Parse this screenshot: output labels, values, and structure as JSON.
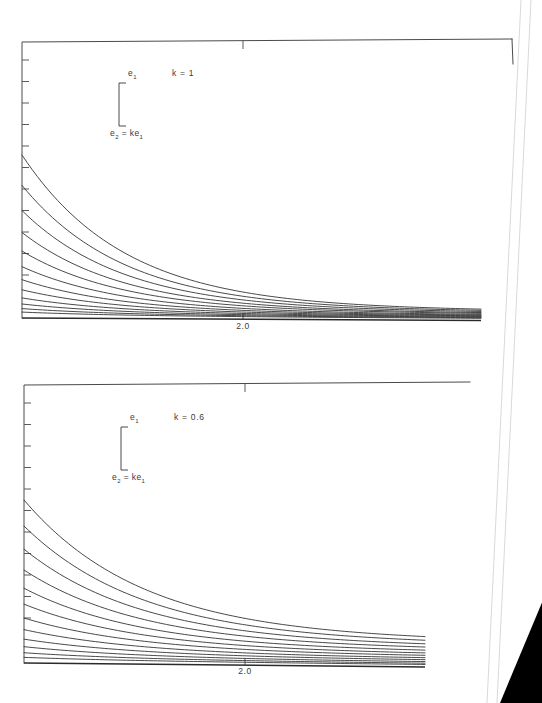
{
  "document": {
    "kind": "scanned-figure-page",
    "background_color": "#ffffff",
    "scanner_background_color": "#000000",
    "ink_color": "#343434",
    "axis_color": "#4a4a4a"
  },
  "chart_data": [
    {
      "id": "top-panel",
      "type": "line",
      "title": "",
      "subtitle": "",
      "annotation_k": "k = 1",
      "annotation_top": "e",
      "annotation_top_sub": "1",
      "annotation_bottom_lhs": "e",
      "annotation_bottom_lhs_sub": "2",
      "annotation_bottom_rhs": "= ke",
      "annotation_bottom_rhs_sub": "1",
      "xlabel": "",
      "ylabel": "",
      "xticklabels": [
        "2.0"
      ],
      "xtick_values": [
        2.0
      ],
      "ytick_count": 11,
      "yticklabels": [],
      "grid": false,
      "legend": "none",
      "xlim": [
        1.0,
        4.6
      ],
      "ylim": [
        0.0,
        1.0
      ],
      "curve_count": 12,
      "series": [
        {
          "name": "curve-1",
          "decay": 2.05,
          "y0": 0.56,
          "yinf": 0.03
        },
        {
          "name": "curve-2",
          "decay": 2.05,
          "y0": 0.455,
          "yinf": 0.027
        },
        {
          "name": "curve-3",
          "decay": 2.05,
          "y0": 0.368,
          "yinf": 0.024
        },
        {
          "name": "curve-4",
          "decay": 2.05,
          "y0": 0.292,
          "yinf": 0.021
        },
        {
          "name": "curve-5",
          "decay": 2.05,
          "y0": 0.228,
          "yinf": 0.019
        },
        {
          "name": "curve-6",
          "decay": 2.05,
          "y0": 0.174,
          "yinf": 0.016
        },
        {
          "name": "curve-7",
          "decay": 2.05,
          "y0": 0.129,
          "yinf": 0.014
        },
        {
          "name": "curve-8",
          "decay": 2.05,
          "y0": 0.094,
          "yinf": 0.012
        },
        {
          "name": "curve-9",
          "decay": 2.05,
          "y0": 0.066,
          "yinf": 0.01
        },
        {
          "name": "curve-10",
          "decay": 2.05,
          "y0": 0.045,
          "yinf": 0.008
        },
        {
          "name": "curve-11",
          "decay": 2.05,
          "y0": 0.029,
          "yinf": 0.006
        },
        {
          "name": "curve-12",
          "decay": 2.05,
          "y0": 0.017,
          "yinf": 0.004
        }
      ]
    },
    {
      "id": "bottom-panel",
      "type": "line",
      "title": "",
      "subtitle": "",
      "annotation_k": "k = 0.6",
      "annotation_top": "e",
      "annotation_top_sub": "1",
      "annotation_bottom_lhs": "e",
      "annotation_bottom_lhs_sub": "2",
      "annotation_bottom_rhs": "= ke",
      "annotation_bottom_rhs_sub": "1",
      "xlabel": "",
      "ylabel": "",
      "xticklabels": [
        "2.0"
      ],
      "xtick_values": [
        2.0
      ],
      "ytick_count": 11,
      "yticklabels": [],
      "grid": false,
      "legend": "none",
      "xlim": [
        1.0,
        4.2
      ],
      "ylim": [
        0.0,
        1.0
      ],
      "curve_count": 12,
      "series": [
        {
          "name": "curve-1",
          "decay": 1.55,
          "y0": 0.56,
          "yinf": 0.086
        },
        {
          "name": "curve-2",
          "decay": 1.55,
          "y0": 0.47,
          "yinf": 0.076
        },
        {
          "name": "curve-3",
          "decay": 1.55,
          "y0": 0.39,
          "yinf": 0.066
        },
        {
          "name": "curve-4",
          "decay": 1.55,
          "y0": 0.318,
          "yinf": 0.057
        },
        {
          "name": "curve-5",
          "decay": 1.55,
          "y0": 0.255,
          "yinf": 0.048
        },
        {
          "name": "curve-6",
          "decay": 1.55,
          "y0": 0.2,
          "yinf": 0.04
        },
        {
          "name": "curve-7",
          "decay": 1.55,
          "y0": 0.152,
          "yinf": 0.033
        },
        {
          "name": "curve-8",
          "decay": 1.55,
          "y0": 0.112,
          "yinf": 0.026
        },
        {
          "name": "curve-9",
          "decay": 1.55,
          "y0": 0.079,
          "yinf": 0.02
        },
        {
          "name": "curve-10",
          "decay": 1.55,
          "y0": 0.053,
          "yinf": 0.014
        },
        {
          "name": "curve-11",
          "decay": 1.55,
          "y0": 0.032,
          "yinf": 0.009
        },
        {
          "name": "curve-12",
          "decay": 1.55,
          "y0": 0.016,
          "yinf": 0.005
        }
      ]
    }
  ],
  "panels": {
    "top": {
      "frame": {
        "left": 22,
        "right": 512,
        "top": 42,
        "bottom": 318
      },
      "plot_right_edge": 481,
      "xtick_x": 243,
      "xtick_label": "2.0",
      "xtick_label_x": 243,
      "xtick_label_y": 329,
      "ytick_top": 60,
      "ytick_step": 21.5,
      "ytick_count": 11,
      "ytick_len": 7,
      "curve_x_start": 22,
      "curve_x_end": 481,
      "curve_y_base": 317,
      "curve_top_y": 155,
      "bracket": {
        "x": 119,
        "y_top": 83,
        "y_bottom": 126,
        "arm": 7
      },
      "label_e1": {
        "x": 128,
        "y": 76
      },
      "label_e2": {
        "x": 110,
        "y": 136
      },
      "label_k": {
        "x": 172,
        "y": 76
      }
    },
    "bottom": {
      "frame": {
        "left": 24,
        "right": 470,
        "top": 385,
        "bottom": 663
      },
      "plot_right_edge": 425,
      "xtick_x": 245,
      "xtick_label": "2.0",
      "xtick_label_x": 245,
      "xtick_label_y": 674,
      "ytick_top": 403,
      "ytick_step": 21.5,
      "ytick_count": 11,
      "ytick_len": 7,
      "curve_x_start": 24,
      "curve_x_end": 425,
      "curve_y_base": 662,
      "curve_top_y": 500,
      "bracket": {
        "x": 121,
        "y_top": 427,
        "y_bottom": 470,
        "arm": 7
      },
      "label_e1": {
        "x": 130,
        "y": 420
      },
      "label_e2": {
        "x": 112,
        "y": 480
      },
      "label_k": {
        "x": 174,
        "y": 420
      }
    }
  },
  "page_edge": {
    "description": "diagonal paper edge at right with dark scanner background in lower-right corner",
    "edge_points": "520,0 543,0 543,703 480,703",
    "shadow_points": "500,703 543,703 543,600"
  }
}
